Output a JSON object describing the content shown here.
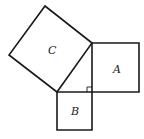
{
  "diagram": {
    "stroke_color": "#1a1a1a",
    "background": "#ffffff",
    "labels": {
      "a": "A",
      "b": "B",
      "c": "C"
    },
    "triangle": {
      "vertices": [
        [
          92,
          43
        ],
        [
          57,
          92
        ],
        [
          92,
          92
        ]
      ],
      "right_angle_at": [
        92,
        92
      ]
    },
    "squares": {
      "A": {
        "points": [
          [
            92,
            43
          ],
          [
            139,
            43
          ],
          [
            139,
            92
          ],
          [
            92,
            92
          ]
        ]
      },
      "B": {
        "points": [
          [
            57,
            92
          ],
          [
            92,
            92
          ],
          [
            92,
            130
          ],
          [
            57,
            130
          ]
        ]
      },
      "C": {
        "points": [
          [
            92,
            43
          ],
          [
            45,
            6
          ],
          [
            9,
            55
          ],
          [
            57,
            92
          ]
        ]
      }
    }
  }
}
